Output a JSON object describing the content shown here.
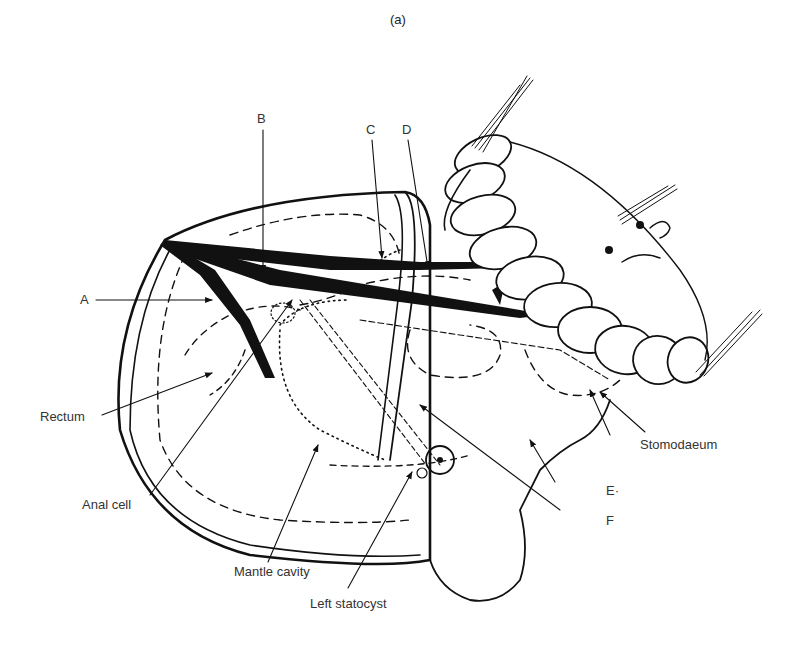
{
  "figure": {
    "panel_label": "(a)",
    "colors": {
      "ink": "#111111",
      "label_text": "#333333",
      "background": "#ffffff"
    }
  },
  "labels": [
    {
      "id": "A",
      "text": "A"
    },
    {
      "id": "B",
      "text": "B"
    },
    {
      "id": "C",
      "text": "C"
    },
    {
      "id": "D",
      "text": "D"
    },
    {
      "id": "E",
      "text": "E·"
    },
    {
      "id": "F",
      "text": "F"
    },
    {
      "id": "rectum",
      "text": "Rectum"
    },
    {
      "id": "anal_cell",
      "text": "Anal cell"
    },
    {
      "id": "mantle_cavity",
      "text": "Mantle cavity"
    },
    {
      "id": "left_statocyst",
      "text": "Left statocyst"
    },
    {
      "id": "stomodaeum",
      "text": "Stomodaeum"
    }
  ]
}
